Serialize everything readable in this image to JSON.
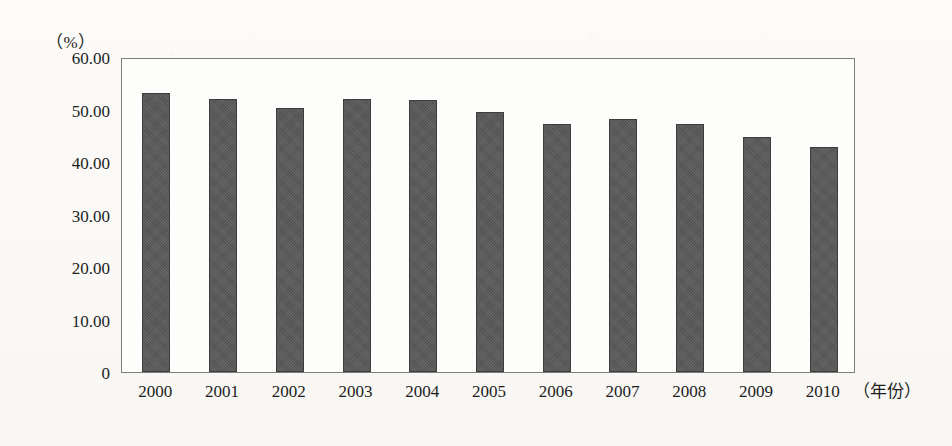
{
  "chart_data": {
    "type": "bar",
    "title": "",
    "subtitle": "",
    "unit_label": "（%）",
    "xlabel": "（年份）",
    "ylabel": "",
    "categories": [
      "2000",
      "2001",
      "2002",
      "2003",
      "2004",
      "2005",
      "2006",
      "2007",
      "2008",
      "2009",
      "2010"
    ],
    "values": [
      53.1,
      52.0,
      50.3,
      52.0,
      51.8,
      49.5,
      47.2,
      48.2,
      47.2,
      44.8,
      42.9
    ],
    "series": [
      {
        "name": "",
        "values": [
          53.1,
          52.0,
          50.3,
          52.0,
          51.8,
          49.5,
          47.2,
          48.2,
          47.2,
          44.8,
          42.9
        ]
      }
    ],
    "ylim": [
      0,
      60
    ],
    "yticks": [
      0,
      10,
      20,
      30,
      40,
      50,
      60
    ],
    "ytick_labels": [
      "0",
      "10.00",
      "20.00",
      "30.00",
      "40.00",
      "50.00",
      "60.00"
    ],
    "grid": false,
    "legend": null,
    "legend_position": "none",
    "bar_color": "#585858",
    "bar_border_color": "#3d3d3d",
    "frame_color": "#7d7d7d",
    "background_color": "#fbfaf7"
  }
}
